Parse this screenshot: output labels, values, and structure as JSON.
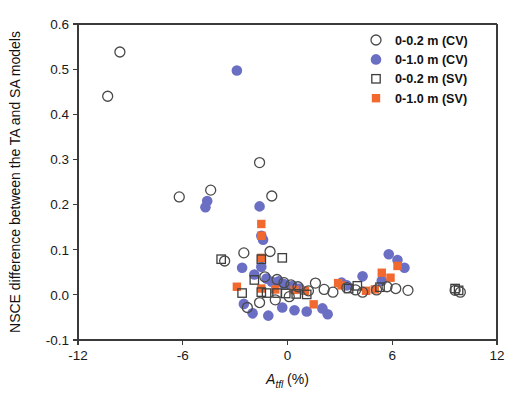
{
  "chart_data": {
    "type": "scatter",
    "title": "",
    "xlabel": "A_tfl (%)",
    "xlabel_main": "A",
    "xlabel_sub": "tfl",
    "xlabel_unit": " (%)",
    "ylabel": "NSCE difference between the TA and SA models",
    "xlim": [
      -12,
      12
    ],
    "ylim": [
      -0.1,
      0.6
    ],
    "xticks": [
      -12,
      -6,
      0,
      6,
      12
    ],
    "xtick_labels": [
      "-12",
      "-6",
      "0",
      "6",
      "12"
    ],
    "yticks": [
      -0.1,
      0.0,
      0.1,
      0.2,
      0.3,
      0.4,
      0.5,
      0.6
    ],
    "ytick_labels": [
      "-0.1",
      "0.0",
      "0.1",
      "0.2",
      "0.3",
      "0.4",
      "0.5",
      "0.6"
    ],
    "grid": false,
    "legend_position": "top-right",
    "colors": {
      "open_circle_stroke": "#4a4a4a",
      "filled_circle": "#6b6fc4",
      "open_square_stroke": "#3d3d3d",
      "filled_square": "#f2692f",
      "axis": "#3a3a3a",
      "text": "#111111",
      "background": "#ffffff"
    },
    "series": [
      {
        "name": "0-0.2 m (CV)",
        "marker": "open-circle",
        "color": "#4a4a4a",
        "points": [
          [
            -9.6,
            0.538
          ],
          [
            -10.3,
            0.44
          ],
          [
            -1.6,
            0.293
          ],
          [
            -4.4,
            0.232
          ],
          [
            -0.9,
            0.219
          ],
          [
            -6.2,
            0.217
          ],
          [
            -2.5,
            0.093
          ],
          [
            -1.0,
            0.096
          ],
          [
            -3.6,
            0.075
          ],
          [
            -1.3,
            0.04
          ],
          [
            -0.6,
            0.034
          ],
          [
            -0.2,
            0.027
          ],
          [
            0.2,
            0.022
          ],
          [
            0.6,
            0.018
          ],
          [
            1.2,
            0.009
          ],
          [
            1.6,
            0.026
          ],
          [
            2.1,
            0.012
          ],
          [
            2.6,
            0.006
          ],
          [
            0.1,
            -0.004
          ],
          [
            -0.7,
            -0.011
          ],
          [
            -2.3,
            -0.028
          ],
          [
            -1.6,
            -0.017
          ],
          [
            3.4,
            0.016
          ],
          [
            3.9,
            0.011
          ],
          [
            4.3,
            0.006
          ],
          [
            5.1,
            0.011
          ],
          [
            5.7,
            0.018
          ],
          [
            6.2,
            0.014
          ],
          [
            6.9,
            0.01
          ],
          [
            9.6,
            0.01
          ],
          [
            9.9,
            0.006
          ]
        ]
      },
      {
        "name": "0-1.0 m (CV)",
        "marker": "filled-circle",
        "color": "#6b6fc4",
        "points": [
          [
            -2.9,
            0.497
          ],
          [
            -4.6,
            0.208
          ],
          [
            -4.7,
            0.194
          ],
          [
            -1.6,
            0.196
          ],
          [
            -1.5,
            0.131
          ],
          [
            -1.4,
            0.122
          ],
          [
            -1.5,
            0.062
          ],
          [
            -2.6,
            0.06
          ],
          [
            -1.9,
            0.045
          ],
          [
            -1.2,
            0.036
          ],
          [
            -0.9,
            0.029
          ],
          [
            -0.5,
            0.03
          ],
          [
            -0.2,
            0.024
          ],
          [
            0.3,
            0.02
          ],
          [
            0.7,
            0.014
          ],
          [
            -2.5,
            -0.02
          ],
          [
            -2.0,
            -0.041
          ],
          [
            -1.1,
            -0.046
          ],
          [
            -0.3,
            -0.028
          ],
          [
            0.4,
            -0.034
          ],
          [
            1.1,
            -0.037
          ],
          [
            2.0,
            -0.03
          ],
          [
            2.3,
            -0.043
          ],
          [
            3.1,
            0.027
          ],
          [
            3.4,
            0.021
          ],
          [
            4.3,
            0.041
          ],
          [
            5.4,
            0.031
          ],
          [
            5.8,
            0.09
          ],
          [
            6.3,
            0.077
          ],
          [
            6.7,
            0.06
          ]
        ]
      },
      {
        "name": "0-0.2 m (SV)",
        "marker": "open-square",
        "color": "#3d3d3d",
        "points": [
          [
            -3.8,
            0.079
          ],
          [
            -1.5,
            0.079
          ],
          [
            -0.3,
            0.082
          ],
          [
            -1.9,
            0.033
          ],
          [
            -2.6,
            0.004
          ],
          [
            -1.5,
            0.006
          ],
          [
            -1.2,
            0.004
          ],
          [
            -0.6,
            0.004
          ],
          [
            -0.1,
            0.003
          ],
          [
            0.5,
            0.002
          ],
          [
            1.1,
            0.001
          ],
          [
            3.5,
            0.014
          ],
          [
            4.0,
            0.02
          ],
          [
            5.3,
            0.017
          ],
          [
            9.6,
            0.014
          ],
          [
            9.8,
            0.01
          ]
        ]
      },
      {
        "name": "0-1.0 m (SV)",
        "marker": "filled-square",
        "color": "#f2692f",
        "points": [
          [
            -1.5,
            0.157
          ],
          [
            -1.5,
            0.131
          ],
          [
            -1.5,
            0.082
          ],
          [
            -1.5,
            0.014
          ],
          [
            -2.9,
            0.018
          ],
          [
            -0.7,
            0.012
          ],
          [
            0.4,
            0.011
          ],
          [
            1.0,
            0.009
          ],
          [
            1.5,
            -0.021
          ],
          [
            2.9,
            0.026
          ],
          [
            3.1,
            0.021
          ],
          [
            4.5,
            0.009
          ],
          [
            5.4,
            0.049
          ],
          [
            5.9,
            0.038
          ],
          [
            5.0,
            0.012
          ],
          [
            6.3,
            0.064
          ]
        ]
      }
    ]
  },
  "legend": {
    "entries": [
      {
        "label": "0-0.2 m (CV)",
        "marker": "open-circle"
      },
      {
        "label": "0-1.0 m (CV)",
        "marker": "filled-circle"
      },
      {
        "label": "0-0.2 m (SV)",
        "marker": "open-square"
      },
      {
        "label": "0-1.0 m (SV)",
        "marker": "filled-square"
      }
    ]
  }
}
